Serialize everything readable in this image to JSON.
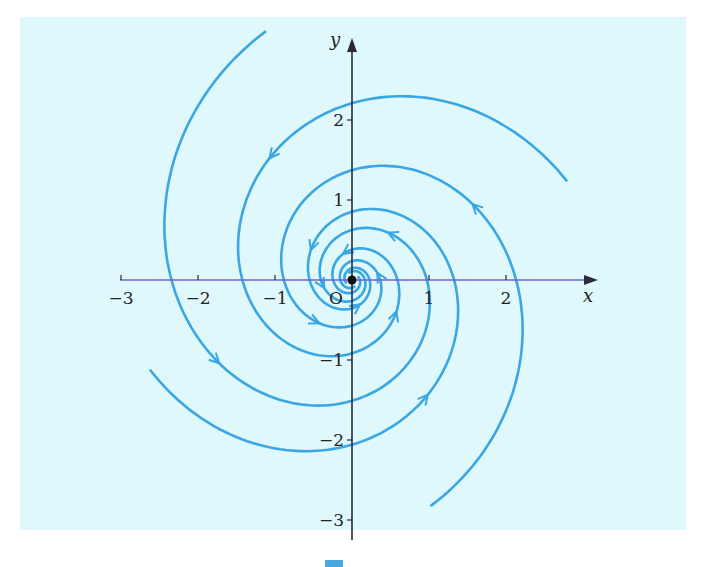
{
  "figure": {
    "type": "phase-portrait",
    "colors": {
      "background": "#dff8fb",
      "trajectory": "#3aa6e4",
      "axis": "#2a2a3a",
      "x_axis_tint": "#7a6ad8"
    },
    "axes": {
      "x_label": "x",
      "y_label": "y",
      "origin_label": "O",
      "x_ticks": [
        {
          "value": -3,
          "label": "−3"
        },
        {
          "value": -2,
          "label": "−2"
        },
        {
          "value": -1,
          "label": "−1"
        },
        {
          "value": 1,
          "label": "1"
        },
        {
          "value": 2,
          "label": "2"
        }
      ],
      "y_ticks": [
        {
          "value": 2,
          "label": "2"
        },
        {
          "value": 1,
          "label": "1"
        },
        {
          "value": -1,
          "label": "−1"
        },
        {
          "value": -2,
          "label": "−2"
        },
        {
          "value": -3,
          "label": "−3"
        }
      ],
      "x_range": [
        -3,
        3
      ],
      "y_range": [
        -3,
        3
      ]
    },
    "trajectories": 4,
    "equilibrium": {
      "x": 0,
      "y": 0,
      "kind": "stable focus"
    }
  }
}
